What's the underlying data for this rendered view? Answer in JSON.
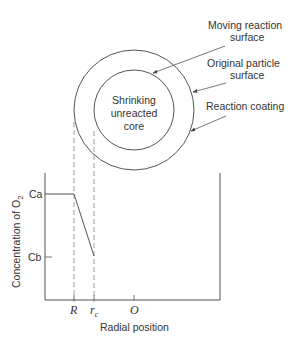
{
  "diagram": {
    "particle": {
      "core_label_lines": [
        "Shrinking",
        "unreacted",
        "core"
      ]
    },
    "callouts": {
      "moving_surface": [
        "Moving reaction",
        "surface"
      ],
      "original_surface": [
        "Original particle",
        "surface"
      ],
      "coating": "Reaction coating"
    },
    "plot": {
      "ylabel": "Concentration of O",
      "ylabel_sub": "2",
      "xlabel": "Radial position",
      "y_ticks": [
        "Ca",
        "Cb"
      ],
      "x_ticks": {
        "R": "R",
        "rc_main": "r",
        "rc_sub": "c",
        "O": "O"
      }
    },
    "colors": {
      "stroke": "#555555",
      "text": "#333333"
    }
  }
}
